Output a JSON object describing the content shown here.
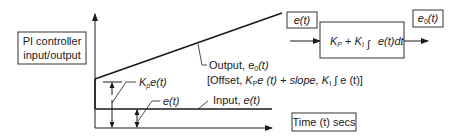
{
  "title_box": {
    "line1": "PI controller",
    "line2": "input/output"
  },
  "graph": {
    "output_label": "Output, e",
    "output_sub": "0",
    "output_arg": "(t)",
    "formula_prefix": "[Offset, ",
    "formula_kp": "K",
    "formula_kp_sub": "P",
    "formula_mid": "e (t) + slope, ",
    "formula_ki": "K",
    "formula_ki_sub": "I",
    "formula_end": " ∫ e (t)]",
    "kp_label": "K",
    "kp_sub": "p",
    "kp_arg": "e(t)",
    "et_label": "e(t)",
    "input_label": "Input, ",
    "input_arg": "e(t)",
    "time_box": "Time (t) secs"
  },
  "block": {
    "input_box": "e(t)",
    "output_box_main": "e",
    "output_box_sub": "0",
    "output_box_arg": "(t)",
    "kp": "K",
    "kp_sub": "P",
    "plus": " + ",
    "ki": "K",
    "ki_sub": "I",
    "integral": "∫",
    "integrand": "e(t)dt"
  }
}
